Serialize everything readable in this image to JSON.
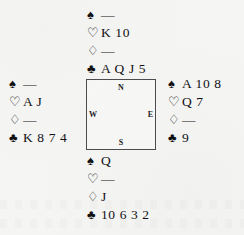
{
  "diagram": {
    "type": "bridge-deal",
    "suit_symbols": {
      "spade": "♠",
      "heart": "♡",
      "diamond": "♢",
      "club": "♣"
    },
    "void_mark": "—",
    "ink_color": "#111114",
    "background_color": "#f5f5f3",
    "border_color": "#4b4b50"
  },
  "compass": {
    "north": "N",
    "west": "W",
    "east": "E",
    "south": "S"
  },
  "hands": {
    "north": {
      "label": "North",
      "spades": "—",
      "hearts": "K 10",
      "diamonds": "—",
      "clubs": "A Q J 5"
    },
    "west": {
      "label": "West",
      "spades": "—",
      "hearts": "A J",
      "diamonds": "—",
      "clubs": "K 8 7 4"
    },
    "east": {
      "label": "East",
      "spades": "A 10 8",
      "hearts": "Q 7",
      "diamonds": "—",
      "clubs": "9"
    },
    "south": {
      "label": "South",
      "spades": "Q",
      "hearts": "—",
      "diamonds": "J",
      "clubs": "10 6 3 2"
    }
  }
}
